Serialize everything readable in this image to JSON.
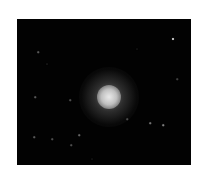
{
  "image": {
    "subject": "star cluster",
    "background_color": "#ffffff",
    "sky_color": "#020202",
    "frame": {
      "x": 17,
      "y": 19,
      "width": 174,
      "height": 146
    },
    "core": {
      "cx": 92,
      "cy": 78,
      "radius_core": 12,
      "radius_halo": 30,
      "color": "#e8e8e8"
    },
    "stars": [
      {
        "x": 156,
        "y": 20,
        "size": 2,
        "brightness": 0.85
      },
      {
        "x": 21,
        "y": 33,
        "size": 1.5,
        "brightness": 0.35
      },
      {
        "x": 18,
        "y": 78,
        "size": 1.5,
        "brightness": 0.35
      },
      {
        "x": 53,
        "y": 81,
        "size": 1.5,
        "brightness": 0.3
      },
      {
        "x": 133,
        "y": 104,
        "size": 1.5,
        "brightness": 0.45
      },
      {
        "x": 146,
        "y": 106,
        "size": 1.5,
        "brightness": 0.5
      },
      {
        "x": 17,
        "y": 118,
        "size": 1.5,
        "brightness": 0.35
      },
      {
        "x": 35,
        "y": 120,
        "size": 1.5,
        "brightness": 0.3
      },
      {
        "x": 62,
        "y": 116,
        "size": 1.5,
        "brightness": 0.4
      },
      {
        "x": 54,
        "y": 126,
        "size": 1.5,
        "brightness": 0.3
      },
      {
        "x": 110,
        "y": 100,
        "size": 1.5,
        "brightness": 0.3
      },
      {
        "x": 160,
        "y": 60,
        "size": 1.5,
        "brightness": 0.25
      },
      {
        "x": 30,
        "y": 45,
        "size": 1,
        "brightness": 0.25
      },
      {
        "x": 120,
        "y": 30,
        "size": 1,
        "brightness": 0.2
      },
      {
        "x": 75,
        "y": 140,
        "size": 1,
        "brightness": 0.2
      }
    ]
  }
}
